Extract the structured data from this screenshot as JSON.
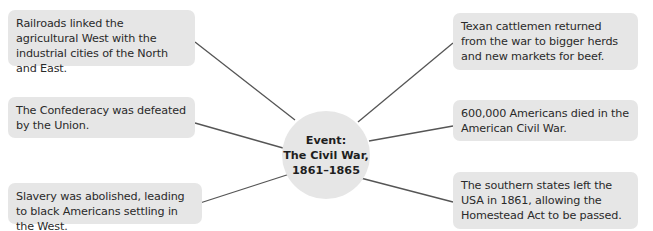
{
  "diagram": {
    "type": "spider-diagram",
    "hub": {
      "line1": "Event:",
      "line2": "The Civil War,",
      "line3": "1861–1865"
    },
    "left_nodes": [
      {
        "text": "Railroads linked the agricultural West with the industrial cities of the North and East."
      },
      {
        "text": "The Confederacy was defeated by the Union."
      },
      {
        "text": "Slavery was abolished, leading to black Americans settling in the West."
      }
    ],
    "right_nodes": [
      {
        "text": "Texan cattlemen returned from the war to bigger herds and new markets for beef."
      },
      {
        "text": "600,000 Americans died in the American Civil War."
      },
      {
        "text": "The southern states left the USA in 1861, allowing the Homestead Act to be passed."
      }
    ],
    "colors": {
      "box_fill": "#e6e6e6",
      "connector": "#555555",
      "text": "#2a2a2a"
    }
  }
}
